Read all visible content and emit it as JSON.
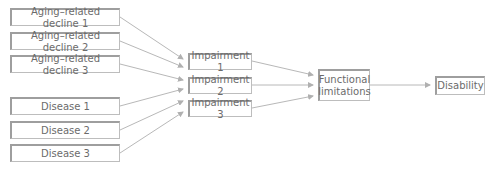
{
  "diagram": {
    "aging_declines": [
      "Aging–related decline 1",
      "Aging–related decline 2",
      "Aging–related decline 3"
    ],
    "diseases": [
      "Disease 1",
      "Disease 2",
      "Disease 3"
    ],
    "impairments": [
      "Impairment 1",
      "Impairment 2",
      "Impairment 3"
    ],
    "functional_limitations": "Functional limitations",
    "disability": "Disability",
    "colors": {
      "line": "#b0b0b0",
      "border": "#9e9e9e",
      "text": "#6b6b6b"
    }
  }
}
